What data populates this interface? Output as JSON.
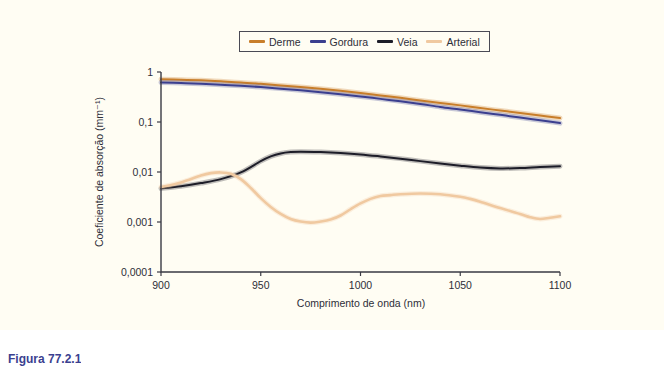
{
  "figure": {
    "caption": "Figura 77.2.1",
    "panel_bg": "#fffdf3"
  },
  "legend": {
    "position": "top-center",
    "items": [
      {
        "label": "Derme",
        "color": "#c87e2a"
      },
      {
        "label": "Gordura",
        "color": "#3b3f8f"
      },
      {
        "label": "Veia",
        "color": "#1d1d28"
      },
      {
        "label": "Arterial",
        "color": "#f0c9a0"
      }
    ]
  },
  "chart_data": {
    "type": "line",
    "title": "",
    "xlabel": "Comprimento de onda (nm)",
    "ylabel": "Coeficiente de absorção (mm⁻¹)",
    "xlim": [
      900,
      1100
    ],
    "ylim": [
      0.0001,
      1
    ],
    "yscale": "log",
    "grid": false,
    "legend_position": "top-center",
    "xticks": [
      900,
      950,
      1000,
      1050,
      1100
    ],
    "xtick_labels": [
      "900",
      "950",
      "1000",
      "1050",
      "1100"
    ],
    "yticks": [
      1,
      0.1,
      0.01,
      0.001,
      0.0001
    ],
    "ytick_labels": [
      "1",
      "0,1",
      "0,01",
      "0,001",
      "0,0001"
    ],
    "series": [
      {
        "name": "Derme",
        "color": "#c87e2a",
        "x": [
          900,
          910,
          920,
          930,
          940,
          950,
          960,
          970,
          980,
          990,
          1000,
          1010,
          1020,
          1030,
          1040,
          1050,
          1060,
          1070,
          1080,
          1090,
          1100
        ],
        "values": [
          0.72,
          0.7,
          0.68,
          0.65,
          0.62,
          0.58,
          0.54,
          0.5,
          0.46,
          0.42,
          0.38,
          0.34,
          0.305,
          0.27,
          0.24,
          0.215,
          0.19,
          0.17,
          0.152,
          0.135,
          0.12
        ]
      },
      {
        "name": "Gordura",
        "color": "#3b3f8f",
        "x": [
          900,
          910,
          920,
          930,
          940,
          950,
          960,
          970,
          980,
          990,
          1000,
          1010,
          1020,
          1030,
          1040,
          1050,
          1060,
          1070,
          1080,
          1090,
          1100
        ],
        "values": [
          0.62,
          0.6,
          0.58,
          0.555,
          0.53,
          0.5,
          0.465,
          0.43,
          0.395,
          0.36,
          0.325,
          0.29,
          0.26,
          0.23,
          0.2,
          0.178,
          0.157,
          0.139,
          0.123,
          0.108,
          0.095
        ]
      },
      {
        "name": "Veia",
        "color": "#1d1d28",
        "x": [
          900,
          910,
          920,
          930,
          940,
          950,
          955,
          960,
          965,
          970,
          980,
          990,
          1000,
          1010,
          1020,
          1030,
          1040,
          1050,
          1060,
          1070,
          1080,
          1090,
          1100
        ],
        "values": [
          0.0047,
          0.0052,
          0.006,
          0.0072,
          0.0098,
          0.0165,
          0.0205,
          0.0235,
          0.025,
          0.0255,
          0.025,
          0.024,
          0.0225,
          0.0205,
          0.0185,
          0.0165,
          0.0148,
          0.0134,
          0.0123,
          0.0118,
          0.012,
          0.0126,
          0.0131
        ]
      },
      {
        "name": "Arterial",
        "color": "#f0c9a0",
        "x": [
          900,
          910,
          920,
          925,
          930,
          935,
          940,
          945,
          950,
          955,
          960,
          965,
          970,
          975,
          980,
          985,
          990,
          995,
          1000,
          1005,
          1010,
          1015,
          1020,
          1030,
          1040,
          1050,
          1055,
          1060,
          1070,
          1080,
          1085,
          1090,
          1095,
          1100
        ],
        "values": [
          0.005,
          0.0062,
          0.0085,
          0.0095,
          0.0098,
          0.0092,
          0.0072,
          0.0048,
          0.003,
          0.002,
          0.00145,
          0.00115,
          0.00102,
          0.00097,
          0.00102,
          0.00112,
          0.00135,
          0.0018,
          0.00235,
          0.0029,
          0.0033,
          0.00345,
          0.0036,
          0.00372,
          0.0036,
          0.0032,
          0.0029,
          0.00255,
          0.0019,
          0.00145,
          0.00125,
          0.00115,
          0.00122,
          0.0013
        ]
      }
    ]
  }
}
